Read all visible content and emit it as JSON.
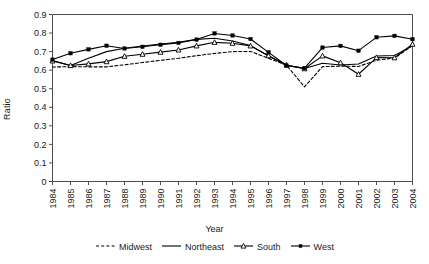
{
  "chart_data": {
    "type": "line",
    "title": "",
    "xlabel": "Year",
    "ylabel": "Ratio",
    "ylim": [
      0,
      0.9
    ],
    "grid": false,
    "legend_position": "bottom",
    "x": [
      1984,
      1985,
      1986,
      1987,
      1988,
      1989,
      1990,
      1991,
      1992,
      1993,
      1994,
      1995,
      1996,
      1997,
      1998,
      1999,
      2000,
      2001,
      2002,
      2003,
      2004
    ],
    "categories": [
      "1984",
      "1985",
      "1986",
      "1987",
      "1988",
      "1989",
      "1990",
      "1991",
      "1992",
      "1993",
      "1994",
      "1995",
      "1996",
      "1997",
      "1998",
      "1999",
      "2000",
      "2001",
      "2002",
      "2003",
      "2004"
    ],
    "ytick_labels": [
      "0",
      "0.1",
      "0.2",
      "0.3",
      "0.4",
      "0.5",
      "0.6",
      "0.7",
      "0.8",
      "0.9"
    ],
    "ytick_values": [
      0,
      0.1,
      0.2,
      0.3,
      0.4,
      0.5,
      0.6,
      0.7,
      0.8,
      0.9
    ],
    "series": [
      {
        "name": "Midwest",
        "style": "dashed",
        "marker": "none",
        "color": "#000000",
        "values": [
          0.617,
          0.619,
          0.618,
          0.618,
          0.629,
          0.641,
          0.653,
          0.664,
          0.678,
          0.69,
          0.7,
          0.701,
          0.664,
          0.627,
          0.51,
          0.619,
          0.622,
          0.62,
          0.654,
          0.665,
          0.733
        ]
      },
      {
        "name": "Northeast",
        "style": "solid",
        "marker": "none",
        "color": "#000000",
        "values": [
          0.652,
          0.625,
          0.664,
          0.7,
          0.718,
          0.73,
          0.741,
          0.75,
          0.766,
          0.772,
          0.757,
          0.733,
          0.676,
          0.626,
          0.609,
          0.637,
          0.628,
          0.633,
          0.676,
          0.679,
          0.731
        ]
      },
      {
        "name": "South",
        "style": "solid",
        "marker": "open-triangle",
        "color": "#000000",
        "values": [
          0.65,
          0.625,
          0.634,
          0.646,
          0.675,
          0.686,
          0.697,
          0.709,
          0.731,
          0.75,
          0.745,
          0.731,
          0.678,
          0.628,
          0.608,
          0.677,
          0.64,
          0.578,
          0.668,
          0.667,
          0.74
        ]
      },
      {
        "name": "West",
        "style": "solid",
        "marker": "filled-square",
        "color": "#000000",
        "values": [
          0.657,
          0.691,
          0.712,
          0.732,
          0.717,
          0.726,
          0.737,
          0.747,
          0.765,
          0.798,
          0.787,
          0.768,
          0.696,
          0.625,
          0.611,
          0.722,
          0.731,
          0.705,
          0.777,
          0.785,
          0.767
        ]
      }
    ]
  },
  "axes": {
    "ylabel": "Ratio",
    "xlabel": "Year"
  },
  "legend": {
    "items": [
      {
        "label": "Midwest"
      },
      {
        "label": "Northeast"
      },
      {
        "label": "South"
      },
      {
        "label": "West"
      }
    ]
  }
}
